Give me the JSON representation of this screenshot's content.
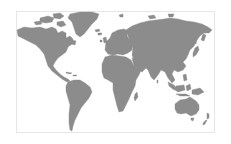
{
  "map": {
    "type": "world-map",
    "projection": "equirectangular-like",
    "land_color": "#8c8c8c",
    "ocean_color": "#ffffff",
    "frame_color": "#e6e6e6",
    "regions": [
      {
        "name": "North America"
      },
      {
        "name": "Greenland"
      },
      {
        "name": "South America"
      },
      {
        "name": "Europe"
      },
      {
        "name": "Africa"
      },
      {
        "name": "Asia"
      },
      {
        "name": "Australia"
      },
      {
        "name": "New Zealand"
      }
    ]
  }
}
